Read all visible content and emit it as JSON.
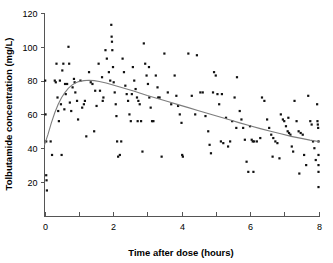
{
  "chart_data": {
    "type": "scatter",
    "title": "",
    "xlabel": "Time after dose (hours)",
    "ylabel": "Tolbutamide concentration (mg/L)",
    "xlim": [
      0,
      8
    ],
    "ylim": [
      0,
      120
    ],
    "xticks": [
      0,
      1,
      2,
      3,
      4,
      5,
      6,
      7,
      8
    ],
    "xtick_labels": [
      "0",
      "",
      "2",
      "",
      "4",
      "",
      "6",
      "",
      "8"
    ],
    "yticks": [
      20,
      40,
      60,
      80,
      100,
      120
    ],
    "ytick_labels": [
      "20",
      "40",
      "60",
      "80",
      "100",
      "120"
    ],
    "grid": false,
    "legend": "none",
    "marker_color": "#111111",
    "curve_color": "#7d7d7d",
    "axis_color": "#555555",
    "series": [
      {
        "name": "Tolbutamide observations",
        "type": "scatter",
        "points": [
          [
            0.02,
            80
          ],
          [
            0.03,
            60
          ],
          [
            0.05,
            44
          ],
          [
            0.05,
            24
          ],
          [
            0.06,
            21
          ],
          [
            0.07,
            15
          ],
          [
            0.18,
            44
          ],
          [
            0.22,
            36
          ],
          [
            0.3,
            80
          ],
          [
            0.33,
            79
          ],
          [
            0.35,
            90
          ],
          [
            0.38,
            70
          ],
          [
            0.4,
            62
          ],
          [
            0.42,
            56
          ],
          [
            0.45,
            80
          ],
          [
            0.48,
            66
          ],
          [
            0.52,
            86
          ],
          [
            0.55,
            90
          ],
          [
            0.58,
            63
          ],
          [
            0.62,
            72
          ],
          [
            0.66,
            78
          ],
          [
            0.7,
            100
          ],
          [
            0.72,
            90
          ],
          [
            0.74,
            67
          ],
          [
            0.78,
            62
          ],
          [
            0.82,
            76
          ],
          [
            0.86,
            81
          ],
          [
            0.9,
            73
          ],
          [
            0.95,
            68
          ],
          [
            0.98,
            57
          ],
          [
            1.05,
            80
          ],
          [
            1.1,
            64
          ],
          [
            1.15,
            66
          ],
          [
            1.22,
            47
          ],
          [
            1.3,
            85
          ],
          [
            1.35,
            79
          ],
          [
            1.4,
            78
          ],
          [
            1.45,
            50
          ],
          [
            1.52,
            65
          ],
          [
            1.58,
            90
          ],
          [
            1.62,
            74
          ],
          [
            1.68,
            82
          ],
          [
            1.72,
            70
          ],
          [
            1.78,
            98
          ],
          [
            1.82,
            93
          ],
          [
            1.88,
            85
          ],
          [
            1.92,
            80
          ],
          [
            1.95,
            113
          ],
          [
            1.96,
            106
          ],
          [
            1.97,
            103
          ],
          [
            1.98,
            98
          ],
          [
            2.0,
            88
          ],
          [
            2.02,
            79
          ],
          [
            2.05,
            73
          ],
          [
            2.08,
            66
          ],
          [
            2.1,
            59
          ],
          [
            2.12,
            44
          ],
          [
            2.15,
            35
          ],
          [
            2.2,
            36
          ],
          [
            2.28,
            93
          ],
          [
            2.32,
            85
          ],
          [
            2.36,
            77
          ],
          [
            2.4,
            72
          ],
          [
            2.44,
            68
          ],
          [
            2.48,
            60
          ],
          [
            2.52,
            56
          ],
          [
            2.58,
            88
          ],
          [
            2.62,
            80
          ],
          [
            2.66,
            75
          ],
          [
            2.7,
            70
          ],
          [
            2.74,
            68
          ],
          [
            2.78,
            66
          ],
          [
            2.82,
            56
          ],
          [
            2.86,
            38
          ],
          [
            2.9,
            102
          ],
          [
            2.94,
            90
          ],
          [
            2.98,
            83
          ],
          [
            3.02,
            78
          ],
          [
            3.06,
            70
          ],
          [
            3.1,
            64
          ],
          [
            3.14,
            56
          ],
          [
            3.18,
            56
          ],
          [
            3.25,
            83
          ],
          [
            3.3,
            76
          ],
          [
            3.36,
            70
          ],
          [
            3.42,
            35
          ],
          [
            3.5,
            96
          ],
          [
            3.6,
            73
          ],
          [
            3.7,
            66
          ],
          [
            3.8,
            83
          ],
          [
            3.85,
            71
          ],
          [
            3.9,
            65
          ],
          [
            3.95,
            60
          ],
          [
            4.0,
            55
          ],
          [
            4.02,
            36
          ],
          [
            4.04,
            35
          ],
          [
            4.2,
            96
          ],
          [
            4.3,
            71
          ],
          [
            4.4,
            60
          ],
          [
            4.55,
            73
          ],
          [
            4.62,
            73
          ],
          [
            4.7,
            59
          ],
          [
            4.78,
            50
          ],
          [
            4.82,
            42
          ],
          [
            4.86,
            37
          ],
          [
            4.95,
            85
          ],
          [
            5.0,
            83
          ],
          [
            5.05,
            72
          ],
          [
            5.1,
            66
          ],
          [
            5.15,
            44
          ],
          [
            5.22,
            43
          ],
          [
            5.3,
            58
          ],
          [
            5.36,
            41
          ],
          [
            5.42,
            44
          ],
          [
            5.48,
            56
          ],
          [
            5.55,
            70
          ],
          [
            5.62,
            82
          ],
          [
            5.7,
            62
          ],
          [
            5.75,
            57
          ],
          [
            5.8,
            52
          ],
          [
            5.85,
            45
          ],
          [
            5.9,
            32
          ],
          [
            5.95,
            26
          ],
          [
            6.0,
            53
          ],
          [
            6.05,
            45
          ],
          [
            6.08,
            44
          ],
          [
            6.12,
            44
          ],
          [
            6.2,
            44
          ],
          [
            6.3,
            46
          ],
          [
            6.42,
            68
          ],
          [
            6.5,
            57
          ],
          [
            6.56,
            52
          ],
          [
            6.62,
            48
          ],
          [
            6.68,
            46
          ],
          [
            6.74,
            44
          ],
          [
            6.8,
            43
          ],
          [
            6.86,
            34
          ],
          [
            6.9,
            60
          ],
          [
            6.96,
            57
          ],
          [
            7.0,
            56
          ],
          [
            7.05,
            53
          ],
          [
            7.1,
            50
          ],
          [
            7.14,
            49
          ],
          [
            7.18,
            48
          ],
          [
            7.22,
            41
          ],
          [
            7.26,
            38
          ],
          [
            7.3,
            68
          ],
          [
            7.36,
            56
          ],
          [
            7.42,
            50
          ],
          [
            7.48,
            49
          ],
          [
            7.54,
            48
          ],
          [
            7.58,
            36
          ],
          [
            7.64,
            30
          ],
          [
            7.7,
            71
          ],
          [
            7.76,
            56
          ],
          [
            7.8,
            54
          ],
          [
            7.84,
            44
          ],
          [
            7.88,
            40
          ],
          [
            7.92,
            33
          ],
          [
            7.96,
            66
          ],
          [
            7.97,
            56
          ],
          [
            7.98,
            54
          ],
          [
            7.99,
            52
          ],
          [
            8.0,
            44
          ],
          [
            8.0,
            36
          ],
          [
            8.0,
            30
          ],
          [
            8.0,
            26
          ],
          [
            8.0,
            17
          ],
          [
            0.6,
            78
          ],
          [
            1.18,
            68
          ],
          [
            2.55,
            72
          ],
          [
            3.05,
            88
          ],
          [
            4.45,
            95
          ],
          [
            5.18,
            72
          ],
          [
            6.35,
            70
          ],
          [
            7.12,
            58
          ],
          [
            2.72,
            56
          ],
          [
            1.7,
            68
          ],
          [
            0.88,
            79
          ],
          [
            3.32,
            70
          ],
          [
            4.92,
            73
          ],
          [
            6.66,
            35
          ],
          [
            7.44,
            25
          ],
          [
            2.24,
            44
          ],
          [
            5.6,
            52
          ],
          [
            6.1,
            26
          ],
          [
            1.48,
            74
          ],
          [
            0.5,
            36
          ]
        ]
      },
      {
        "name": "Fitted concentration curve",
        "type": "line",
        "points": [
          [
            0.0,
            42
          ],
          [
            0.1,
            48
          ],
          [
            0.2,
            55
          ],
          [
            0.3,
            61
          ],
          [
            0.4,
            66
          ],
          [
            0.5,
            70
          ],
          [
            0.6,
            73
          ],
          [
            0.7,
            75.5
          ],
          [
            0.8,
            77.3
          ],
          [
            0.9,
            78.6
          ],
          [
            1.0,
            79.4
          ],
          [
            1.15,
            80.0
          ],
          [
            1.3,
            80.2
          ],
          [
            1.45,
            80.0
          ],
          [
            1.6,
            79.5
          ],
          [
            1.8,
            78.6
          ],
          [
            2.0,
            77.4
          ],
          [
            2.2,
            76.2
          ],
          [
            2.4,
            75.0
          ],
          [
            2.6,
            73.8
          ],
          [
            2.8,
            72.5
          ],
          [
            3.0,
            71.2
          ],
          [
            3.3,
            69.4
          ],
          [
            3.6,
            67.6
          ],
          [
            3.9,
            65.8
          ],
          [
            4.2,
            64.0
          ],
          [
            4.5,
            62.2
          ],
          [
            4.8,
            60.4
          ],
          [
            5.1,
            58.6
          ],
          [
            5.4,
            56.8
          ],
          [
            5.7,
            55.0
          ],
          [
            6.0,
            53.3
          ],
          [
            6.3,
            51.6
          ],
          [
            6.6,
            50.0
          ],
          [
            6.9,
            48.5
          ],
          [
            7.2,
            47.0
          ],
          [
            7.5,
            45.8
          ],
          [
            7.75,
            44.8
          ],
          [
            8.0,
            44.0
          ]
        ]
      }
    ]
  }
}
